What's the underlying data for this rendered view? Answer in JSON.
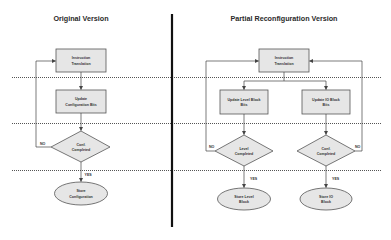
{
  "left_panel": {
    "title": "Original Version",
    "instruction_box": [
      "Instruction",
      "Translation"
    ],
    "update_box": [
      "Update",
      "Configuration Bits"
    ],
    "decision": [
      "Conf.",
      "Completed"
    ],
    "terminal": [
      "Store",
      "Configuration"
    ],
    "no_label": "NO",
    "yes_label": "YES"
  },
  "right_panel": {
    "title": "Partial Reconfiguration Version",
    "instruction_box": [
      "Instruction",
      "Translation"
    ],
    "update_level_box": [
      "Update Level Block",
      "Bits"
    ],
    "update_io_box": [
      "Update IO Block",
      "Bits"
    ],
    "decision_level": [
      "Level",
      "Completed"
    ],
    "decision_conf": [
      "Conf.",
      "Completed"
    ],
    "terminal_level": [
      "Store Level",
      "Block"
    ],
    "terminal_io": [
      "Store IO",
      "Block"
    ],
    "no_label_left": "NO",
    "no_label_right": "NO",
    "yes_label_left": "YES",
    "yes_label_right": "YES"
  },
  "colors": {
    "shape_fill": "#e6e6e6",
    "shape_stroke": "#555555",
    "divider": "#111111"
  }
}
